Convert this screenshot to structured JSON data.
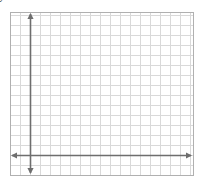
{
  "figure": {
    "colors": {
      "background": "#ffffff",
      "grid": "#d9d9d9",
      "frame": "#b0b0b0",
      "axis": "#6e6e6e",
      "segment": "#808080",
      "point": "#707070",
      "text": "#1a1a1a"
    },
    "frame": {
      "x": 10,
      "y": 12,
      "width": 183,
      "height": 163
    },
    "origin_px": {
      "x": 30,
      "y": 155
    },
    "unit_px": 10
  },
  "axes": {
    "x": {
      "label": "x",
      "ticks": [
        "2",
        "4",
        "6",
        "8",
        "10",
        "12"
      ],
      "tick_values": [
        2,
        4,
        6,
        8,
        10,
        12
      ],
      "range": [
        -1,
        13
      ]
    },
    "y": {
      "label": "y",
      "ticks": [
        "2",
        "4",
        "6",
        "8",
        "10"
      ],
      "tick_values": [
        2,
        4,
        6,
        8,
        10
      ],
      "range": [
        -1,
        13
      ]
    },
    "origin_label": "O"
  },
  "chart_data": {
    "type": "scatter",
    "title": "",
    "xlabel": "x",
    "ylabel": "y",
    "xlim": [
      -1,
      13
    ],
    "ylim": [
      -1,
      13
    ],
    "grid": true,
    "points": [
      {
        "name": "A",
        "x": 0,
        "y": 2,
        "label": "A",
        "label_dx": 2,
        "label_dy": 11
      },
      {
        "name": "L",
        "x": 4,
        "y": 2,
        "label": "L",
        "label_dx": 3,
        "label_dy": 12
      },
      {
        "name": "B",
        "x": 4,
        "y": 5,
        "label": "B",
        "label_dx": -9,
        "label_dy": -4
      },
      {
        "name": "M",
        "x": 12,
        "y": 5,
        "label": "M",
        "label_dx": 3,
        "label_dy": 12
      },
      {
        "name": "C",
        "x": 12,
        "y": 11,
        "label": "C",
        "label_dx": -1,
        "label_dy": -5
      }
    ],
    "segments": [
      {
        "name": "A-C",
        "from": "A",
        "to": "C",
        "label": "",
        "label_x": 0,
        "label_y": 0
      },
      {
        "name": "A-L",
        "from": "A",
        "to": "L",
        "label": "x",
        "label_x": 2.0,
        "label_y": 2.75
      },
      {
        "name": "L-B",
        "from": "L",
        "to": "B",
        "label": "w",
        "label_x": 4.45,
        "label_y": 3.6
      },
      {
        "name": "B-M",
        "from": "B",
        "to": "M",
        "label": "z",
        "label_x": 7.4,
        "label_y": 5.75
      },
      {
        "name": "M-C",
        "from": "M",
        "to": "C",
        "label": "y",
        "label_x": 11.5,
        "label_y": 9.4
      }
    ]
  }
}
